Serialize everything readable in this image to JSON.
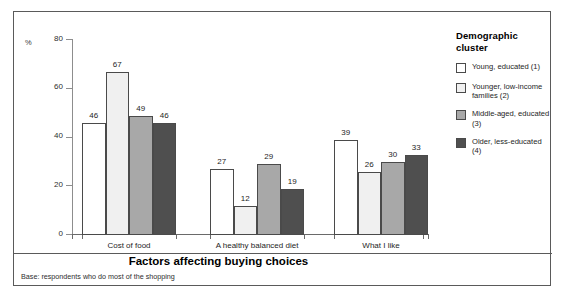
{
  "chart_data": {
    "type": "bar",
    "title": "",
    "xlabel": "Factors affecting buying choices",
    "ylabel": "%",
    "ylim": [
      0,
      80
    ],
    "yticks": [
      0,
      20,
      40,
      60,
      80
    ],
    "grid": false,
    "legend_position": "right",
    "legend_title": "Demographic cluster",
    "categories": [
      "Cost of food",
      "A healthy balanced diet",
      "What I like"
    ],
    "series": [
      {
        "name": "Young, educated (1)",
        "color": "#ffffff",
        "values": [
          46,
          27,
          39
        ]
      },
      {
        "name": "Younger, low-income families (2)",
        "color": "#f0f0f0",
        "values": [
          67,
          12,
          26
        ]
      },
      {
        "name": "Middle-aged, educated (3)",
        "color": "#a8a8a8",
        "values": [
          49,
          29,
          30
        ]
      },
      {
        "name": "Older, less-educated (4)",
        "color": "#4f4f4f",
        "values": [
          46,
          19,
          33
        ]
      }
    ],
    "footnote": "Base: respondents who do most of the shopping"
  },
  "axis": {
    "unit_label": "%",
    "tick_labels": [
      "0",
      "20",
      "40",
      "60",
      "80"
    ]
  },
  "legend": {
    "title": "Demographic cluster",
    "items": [
      {
        "label": "Young, educated (1)"
      },
      {
        "label": "Younger, low-income families (2)"
      },
      {
        "label": "Middle-aged, educated (3)"
      },
      {
        "label": "Older, less-educated (4)"
      }
    ]
  },
  "footer": {
    "x_title": "Factors affecting buying choices",
    "base_note": "Base: respondents who do most of the shopping"
  }
}
